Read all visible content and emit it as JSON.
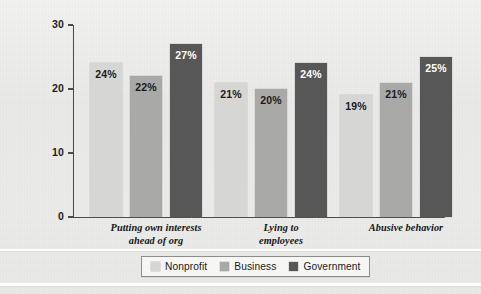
{
  "chart_data": {
    "type": "bar",
    "title": "",
    "subtitle": "",
    "xlabel": "",
    "ylabel": "",
    "ylim": [
      0,
      30
    ],
    "yticks": [
      0,
      10,
      20,
      30
    ],
    "ytick_labels": [
      "0",
      "10",
      "20",
      "30"
    ],
    "grid": false,
    "legend_position": "bottom",
    "value_suffix": "%",
    "categories": [
      "Putting own interests ahead of org",
      "Lying to employees",
      "Abusive behavior"
    ],
    "category_lines": [
      [
        "Putting own interests",
        "ahead of org"
      ],
      [
        "Lying to",
        "employees"
      ],
      [
        "Abusive behavior"
      ]
    ],
    "series": [
      {
        "name": "Nonprofit",
        "color": "#d6d6d4",
        "label_color": "#1b1b1b",
        "values": [
          24,
          21,
          19
        ],
        "labels": [
          "24%",
          "21%",
          "19%"
        ]
      },
      {
        "name": "Business",
        "color": "#a9a9a7",
        "label_color": "#1b1b1b",
        "values": [
          22,
          20,
          21
        ],
        "labels": [
          "22%",
          "20%",
          "21%"
        ]
      },
      {
        "name": "Government",
        "color": "#575757",
        "label_color": "#ffffff",
        "values": [
          27,
          24,
          25
        ],
        "labels": [
          "27%",
          "24%",
          "25%"
        ]
      }
    ]
  },
  "legend": {
    "items": [
      {
        "label": "Nonprofit",
        "color": "#d6d6d4"
      },
      {
        "label": "Business",
        "color": "#a9a9a7"
      },
      {
        "label": "Government",
        "color": "#575757"
      }
    ]
  },
  "colors": {
    "background": "#ececeb",
    "axis": "#4a4a4a",
    "text": "#1b1b1b",
    "legend_border": "#8d8d8b",
    "legend_background": "#f6f6f5"
  }
}
